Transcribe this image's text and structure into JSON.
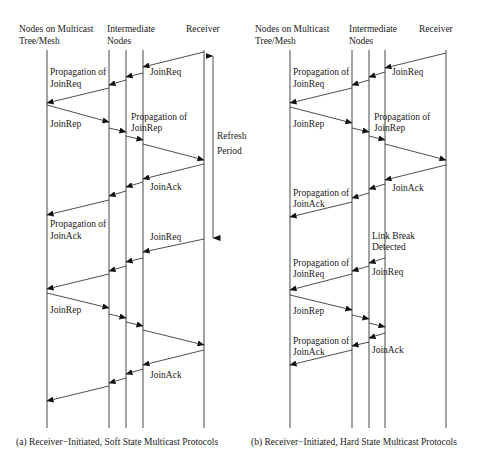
{
  "panel_a": {
    "header": {
      "col1_line1": "Nodes on Multicast",
      "col1_line2": "Tree/Mesh",
      "col2_line1": "Intermediate",
      "col2_line2": "Nodes",
      "col3": "Receiver"
    },
    "labels": {
      "join_req_1": "JoinReq",
      "prop_join_req_1": "Propagation of",
      "prop_join_req_2": "JoinReq",
      "join_rep_1": "JoinRep",
      "prop_join_rep_1": "Propagation of",
      "prop_join_rep_2": "JoinRep",
      "refresh_1": "Refresh",
      "refresh_2": "Period",
      "join_ack_1": "JoinAck",
      "prop_join_ack_1": "Propagation of",
      "prop_join_ack_2": "JoinAck",
      "join_req_2": "JoinReq",
      "join_rep_2": "JoinRep",
      "join_ack_2": "JoinAck"
    },
    "caption": "(a) Receiver−Initiated, Soft State Multicast Protocols"
  },
  "panel_b": {
    "header": {
      "col1_line1": "Nodes on Multicast",
      "col1_line2": "Tree/Mesh",
      "col2_line1": "Intermediate",
      "col2_line2": "Nodes",
      "col3": "Receiver"
    },
    "labels": {
      "join_req_1": "JoinReq",
      "prop_join_req_1": "Propagation of",
      "prop_join_req_2": "JoinReq",
      "join_rep_1": "JoinRep",
      "prop_join_rep_1": "Propagation of",
      "prop_join_rep_2": "JoinRep",
      "join_ack_1": "JoinAck",
      "prop_join_ack_1": "Propagation of",
      "prop_join_ack_2": "JoinAck",
      "link_break_1": "Link Break",
      "link_break_2": "Detected",
      "prop_join_req_b1": "Propagation of",
      "prop_join_req_b2": "JoinReq",
      "join_req_2": "JoinReq",
      "join_rep_2": "JoinRep",
      "prop_join_ack_b1": "Propagation of",
      "prop_join_ack_b2": "JoinAck",
      "join_ack_2": "JoinAck"
    },
    "caption": "(b) Receiver−Initiated, Hard State Multicast Protocols"
  }
}
